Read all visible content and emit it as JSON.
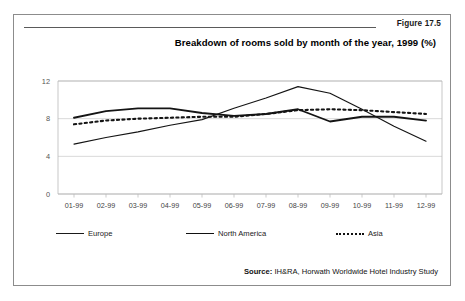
{
  "figure": {
    "number_label": "Figure 17.5",
    "title": "Breakdown of rooms sold by month of the year, 1999 (%)",
    "source_prefix": "Source:",
    "source_text": "IH&RA, Horwath Worldwide Hotel Industry Study"
  },
  "chart_data": {
    "type": "line",
    "title": "Breakdown of rooms sold by month of the year, 1999 (%)",
    "xlabel": "",
    "ylabel": "",
    "categories": [
      "01-99",
      "02-99",
      "03-99",
      "04-99",
      "05-99",
      "06-99",
      "07-99",
      "08-99",
      "09-99",
      "10-99",
      "11-99",
      "12-99"
    ],
    "ylim": [
      0,
      12
    ],
    "yticks": [
      0,
      4,
      8,
      12
    ],
    "grid": true,
    "legend_position": "bottom",
    "series": [
      {
        "name": "Europe",
        "style": "solid-thin",
        "values": [
          5.3,
          6.0,
          6.6,
          7.3,
          7.9,
          9.1,
          10.2,
          11.4,
          10.7,
          9.0,
          7.2,
          5.6
        ]
      },
      {
        "name": "North America",
        "style": "solid-thick",
        "values": [
          8.1,
          8.8,
          9.1,
          9.1,
          8.6,
          8.3,
          8.5,
          9.0,
          7.7,
          8.2,
          8.2,
          7.8
        ]
      },
      {
        "name": "Asia",
        "style": "dotted",
        "values": [
          7.4,
          7.8,
          8.0,
          8.1,
          8.2,
          8.2,
          8.5,
          8.9,
          9.0,
          8.9,
          8.7,
          8.5
        ]
      }
    ]
  },
  "legend": {
    "items": [
      {
        "label": "Europe"
      },
      {
        "label": "North America"
      },
      {
        "label": "Asia"
      }
    ]
  }
}
